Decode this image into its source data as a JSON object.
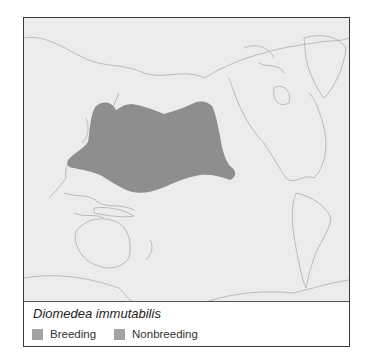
{
  "map": {
    "range_color": "#8e8e8e",
    "land_outline_color": "#ffffff",
    "ocean_color": "#ececec"
  },
  "legend": {
    "species": "Diomedea immutabilis",
    "items": [
      {
        "label": "Breeding",
        "color": "#a3a3a3"
      },
      {
        "label": "Nonbreeding",
        "color": "#a3a3a3"
      }
    ]
  }
}
